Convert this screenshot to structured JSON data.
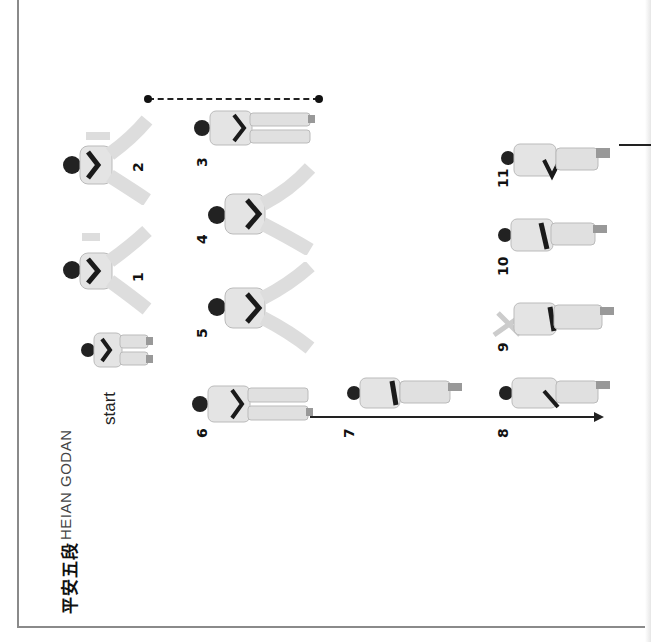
{
  "page": {
    "orientation": "rotated-90-ccw",
    "title_kanji": "平安五段",
    "title_latin": "HEIAN GODAN",
    "start_label": "start"
  },
  "steps": [
    {
      "id": "start",
      "label": "start"
    },
    {
      "id": "1",
      "label": "1"
    },
    {
      "id": "2",
      "label": "2"
    },
    {
      "id": "3",
      "label": "3"
    },
    {
      "id": "4",
      "label": "4"
    },
    {
      "id": "5",
      "label": "5"
    },
    {
      "id": "6",
      "label": "6"
    },
    {
      "id": "7",
      "label": "7"
    },
    {
      "id": "8",
      "label": "8"
    },
    {
      "id": "9",
      "label": "9"
    },
    {
      "id": "10",
      "label": "10"
    },
    {
      "id": "11",
      "label": "11"
    }
  ],
  "colors": {
    "border": "#8a8a8a",
    "ink": "#111111",
    "gi": "#e4e4e4",
    "belt": "#1a1a1a"
  }
}
